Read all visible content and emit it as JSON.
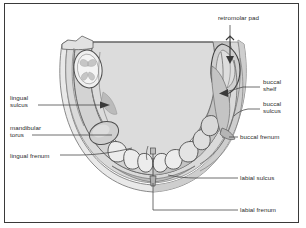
{
  "figure": {
    "type": "anatomical-diagram",
    "view": "occlusal view of the mandible / lower denture bearing area",
    "frame": {
      "visible": true,
      "color": "#3a3a3a"
    },
    "palette": {
      "background": "#ffffff",
      "frame_border": "#3a3a3a",
      "tongue_fill": "#dcdcdc",
      "ridge_fill": "#d2d2d2",
      "mucosa_fill": "#e7e7e7",
      "tooth_fill": "#ededed",
      "outline_dark": "#4a4a4a",
      "outline_mid": "#7d7d7d",
      "shadow_gray": "#bdbdbd",
      "leader_line": "#4a4a4a",
      "text": "#2b2b2b"
    }
  },
  "labels": [
    {
      "id": "retromolar-pad",
      "text": "retromolar pad",
      "side": "top",
      "lines": [
        "retromolar pad"
      ],
      "x": 218,
      "y": 17,
      "has_arrow": true,
      "arrow_direction": "down"
    },
    {
      "id": "buccal-shelf",
      "text": "buccal shelf",
      "side": "right",
      "lines": [
        "buccal",
        "shelf"
      ],
      "x": 263,
      "y": 82,
      "has_arrow": true,
      "arrow_direction": "left"
    },
    {
      "id": "buccal-sulcus",
      "text": "buccal sulcus",
      "side": "right",
      "lines": [
        "buccal",
        "sulcus"
      ],
      "x": 263,
      "y": 104,
      "has_arrow": false,
      "arrow_direction": "none"
    },
    {
      "id": "buccal-frenum",
      "text": "buccal frenum",
      "side": "right",
      "lines": [
        "buccal frenum"
      ],
      "x": 240,
      "y": 135,
      "has_arrow": false,
      "arrow_direction": "none"
    },
    {
      "id": "labial-sulcus",
      "text": "labial sulcus",
      "side": "right",
      "lines": [
        "labial sulcus"
      ],
      "x": 240,
      "y": 176,
      "has_arrow": false,
      "arrow_direction": "none"
    },
    {
      "id": "labial-frenum",
      "text": "labial frenum",
      "side": "right",
      "lines": [
        "labial frenum"
      ],
      "x": 240,
      "y": 208,
      "has_arrow": false,
      "arrow_direction": "none"
    },
    {
      "id": "lingual-sulcus",
      "text": "lingual sulcus",
      "side": "left",
      "lines": [
        "lingual",
        "sulcus"
      ],
      "x": 10,
      "y": 95,
      "has_arrow": true,
      "arrow_direction": "right"
    },
    {
      "id": "mandibular-torus",
      "text": "mandibular torus",
      "side": "left",
      "lines": [
        "mandibular",
        "torus"
      ],
      "x": 10,
      "y": 124,
      "has_arrow": false,
      "arrow_direction": "none"
    },
    {
      "id": "lingual-frenum",
      "text": "lingual frenum",
      "side": "left",
      "lines": [
        "lingual frenum"
      ],
      "x": 10,
      "y": 152,
      "has_arrow": false,
      "arrow_direction": "none"
    }
  ]
}
